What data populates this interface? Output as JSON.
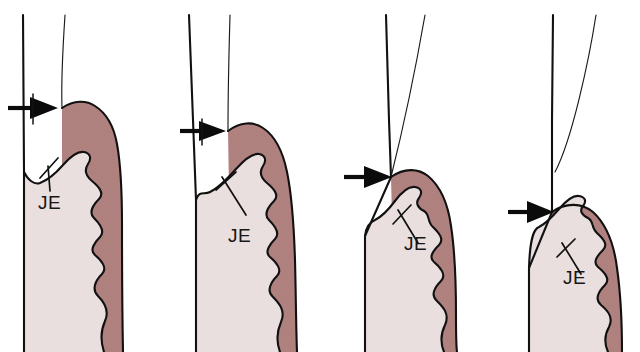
{
  "figure": {
    "background_color": "#ffffff",
    "width": 640,
    "height": 352,
    "panel_count": 4
  },
  "colors": {
    "gingiva_fill": "#b0827f",
    "gingiva_fill_light": "#b98f8c",
    "tooth_fill": "#e9e0df",
    "tooth_fill_shadow": "#ded2d2",
    "outline": "#111111",
    "arrow": "#0b0b0b",
    "label_text": "#161616"
  },
  "panels": [
    {
      "id": "panel-1",
      "index": 1,
      "label": "JE",
      "label_x": 38,
      "label_y": 209,
      "arrow": {
        "name": "gingival-margin-arrow",
        "tip_x": 56,
        "tip_y": 108,
        "tail_x": 8,
        "tail_y": 108,
        "direction": "right",
        "has_crossbar": true
      },
      "description": "Arrow at coronal gingival margin; junctional epithelium high on crown"
    },
    {
      "id": "panel-2",
      "index": 2,
      "label": "JE",
      "label_x": 228,
      "label_y": 242,
      "arrow": {
        "name": "gingival-margin-arrow",
        "tip_x": 224,
        "tip_y": 131,
        "tail_x": 180,
        "tail_y": 131,
        "direction": "right",
        "has_crossbar": true
      },
      "description": "Arrow slightly more apical; junctional epithelium migrated apically"
    },
    {
      "id": "panel-3",
      "index": 3,
      "label": "JE",
      "label_x": 404,
      "label_y": 250,
      "arrow": {
        "name": "gingival-margin-arrow",
        "tip_x": 390,
        "tip_y": 177,
        "tail_x": 344,
        "tail_y": 177,
        "direction": "right",
        "has_crossbar": false
      },
      "description": "Arrow at further apical level; attachment loss increased"
    },
    {
      "id": "panel-4",
      "index": 4,
      "label": "JE",
      "label_x": 563,
      "label_y": 284,
      "arrow": {
        "name": "gingival-margin-arrow",
        "tip_x": 551,
        "tip_y": 212,
        "tail_x": 508,
        "tail_y": 212,
        "direction": "right",
        "has_crossbar": false
      },
      "description": "Arrow at most apical level; greatest junctional epithelium migration"
    }
  ]
}
